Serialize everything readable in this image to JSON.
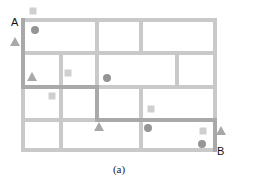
{
  "figure": {
    "caption": "(a)",
    "start_label": "A",
    "end_label": "B"
  },
  "colors": {
    "grid_line": "#c9c9c9",
    "path_line": "#a9a9a9",
    "square": "#cfcfcf",
    "circle": "#959595",
    "triangle": "#a8a8a8",
    "text": "#111111"
  },
  "grid": {
    "outer": {
      "x": 23,
      "y": 20,
      "w": 192,
      "h": 130
    },
    "horizontal_lines_y": [
      53,
      87,
      120
    ],
    "rows": [
      {
        "y1": 20,
        "y2": 53,
        "verticals_x": [
          97,
          141
        ]
      },
      {
        "y1": 53,
        "y2": 87,
        "verticals_x": [
          61,
          97,
          177
        ]
      },
      {
        "y1": 87,
        "y2": 120,
        "verticals_x": [
          61,
          97,
          141
        ]
      },
      {
        "y1": 120,
        "y2": 150,
        "verticals_x": [
          61,
          141
        ]
      }
    ]
  },
  "highlighted_path": [
    [
      23,
      20
    ],
    [
      23,
      87
    ],
    [
      97,
      87
    ],
    [
      97,
      120
    ],
    [
      215,
      120
    ],
    [
      215,
      150
    ]
  ],
  "markers": {
    "squares": [
      [
        33,
        11
      ],
      [
        68,
        73
      ],
      [
        52,
        96
      ],
      [
        151,
        109
      ],
      [
        203,
        131
      ]
    ],
    "circles": [
      [
        35,
        30
      ],
      [
        107,
        78
      ],
      [
        148,
        128
      ],
      [
        202,
        144
      ]
    ],
    "triangles": [
      [
        15,
        42
      ],
      [
        32,
        77
      ],
      [
        99,
        127
      ],
      [
        221,
        131
      ]
    ]
  },
  "labels": {
    "A": {
      "x": 11,
      "y": 26
    },
    "B": {
      "x": 217,
      "y": 155
    },
    "caption": {
      "x": 119,
      "y": 173
    }
  }
}
